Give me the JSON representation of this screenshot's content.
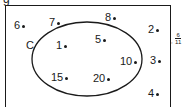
{
  "top_label": "g",
  "universe": {
    "label": ""
  },
  "set": {
    "label": "C",
    "members": [
      "1",
      "5",
      "10",
      "15",
      "20"
    ]
  },
  "points": [
    {
      "label": "6",
      "x": 14,
      "y": 20
    },
    {
      "label": "7",
      "x": 49,
      "y": 17
    },
    {
      "label": "8",
      "x": 105,
      "y": 12
    },
    {
      "label": "2",
      "x": 148,
      "y": 24
    },
    {
      "label": "1",
      "x": 56,
      "y": 40
    },
    {
      "label": "5",
      "x": 95,
      "y": 34
    },
    {
      "label": "10",
      "x": 120,
      "y": 56
    },
    {
      "label": "3",
      "x": 150,
      "y": 55
    },
    {
      "label": "15",
      "x": 51,
      "y": 72
    },
    {
      "label": "20",
      "x": 93,
      "y": 73
    },
    {
      "label": "4",
      "x": 148,
      "y": 88
    }
  ],
  "side_annotation": {
    "prefix": ",",
    "numerator": "6",
    "denominator": "11"
  }
}
